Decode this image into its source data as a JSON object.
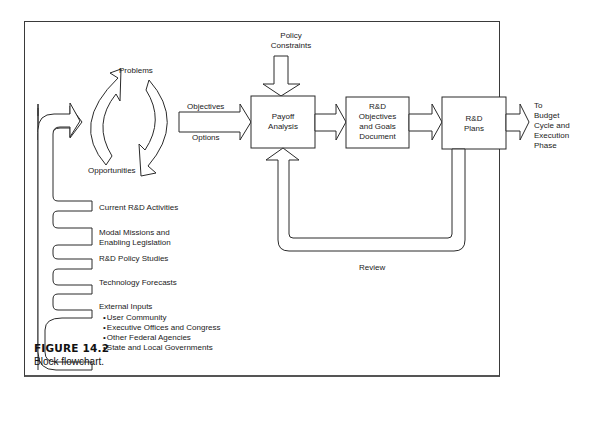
{
  "figure": {
    "number": "FIGURE 14.2",
    "caption": "Block flowchart."
  },
  "cycle": {
    "top_label": "Problems",
    "bottom_label": "Opportunities"
  },
  "arrows": {
    "objectives": "Objectives",
    "options": "Options",
    "policy_constraints_line1": "Policy",
    "policy_constraints_line2": "Constraints",
    "review": "Review",
    "output_lines": [
      "To",
      "Budget",
      "Cycle and",
      "Execution",
      "Phase"
    ]
  },
  "boxes": {
    "payoff": [
      "Payoff",
      "Analysis"
    ],
    "objectives_doc": [
      "R&D",
      "Objectives",
      "and Goals",
      "Document"
    ],
    "plans": [
      "R&D",
      "Plans"
    ]
  },
  "inputs": [
    {
      "label": "Current R&D Activities"
    },
    {
      "label": "Modal Missions and",
      "label2": "Enabling Legislation"
    },
    {
      "label": "R&D Policy Studies"
    },
    {
      "label": "Technology Forecasts"
    },
    {
      "label": "External Inputs"
    }
  ],
  "external_inputs": [
    "User Community",
    "Executive Offices and Congress",
    "Other Federal Agencies",
    "State and Local Governments"
  ]
}
